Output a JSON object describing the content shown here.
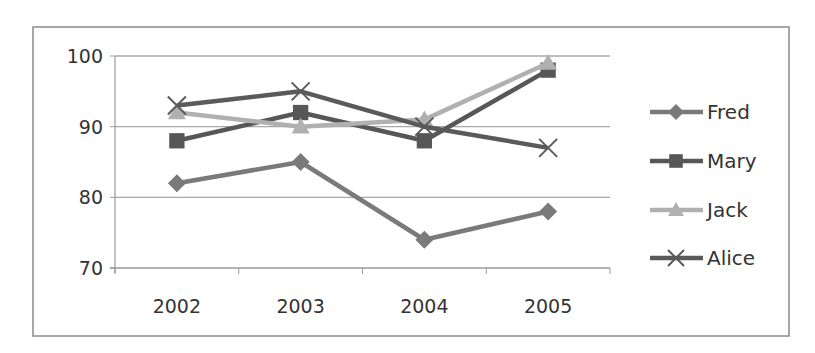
{
  "chart_data": {
    "type": "line",
    "title": "",
    "xlabel": "",
    "ylabel": "",
    "categories": [
      "2002",
      "2003",
      "2004",
      "2005"
    ],
    "ylim": [
      70,
      100
    ],
    "yticks": [
      70,
      80,
      90,
      100
    ],
    "grid": true,
    "legend_position": "right",
    "series": [
      {
        "name": "Fred",
        "marker": "diamond",
        "color": "#7a7a7a",
        "values": [
          82,
          85,
          74,
          78
        ]
      },
      {
        "name": "Mary",
        "marker": "square",
        "color": "#575757",
        "values": [
          88,
          92,
          88,
          98
        ]
      },
      {
        "name": "Jack",
        "marker": "triangle",
        "color": "#b0b0b0",
        "values": [
          92,
          90,
          91,
          99
        ]
      },
      {
        "name": "Alice",
        "marker": "x",
        "color": "#5a5a5a",
        "values": [
          93,
          95,
          90,
          87
        ]
      }
    ]
  },
  "colors": {
    "frame": "#8a8a8a",
    "gridline": "#a8a8a8",
    "axis": "#9a9a9a",
    "text": "#333333",
    "background": "#ffffff"
  }
}
